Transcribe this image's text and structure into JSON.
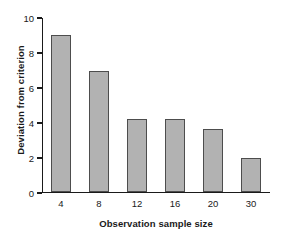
{
  "chart_data": {
    "type": "bar",
    "title": "",
    "xlabel": "Observation sample size",
    "ylabel": "Deviation from criterion",
    "categories": [
      "4",
      "8",
      "12",
      "16",
      "20",
      "30"
    ],
    "values": [
      9.0,
      6.9,
      4.15,
      4.15,
      3.6,
      1.95
    ],
    "ylim": [
      0,
      10
    ],
    "yticks": [
      "0",
      "2",
      "4",
      "6",
      "8",
      "10"
    ],
    "ytick_values": [
      0,
      2,
      4,
      6,
      8,
      10
    ],
    "grid": false,
    "legend": null,
    "bar_color": "#b2b2b2",
    "bar_edge_color": "#4d4d4d",
    "axis_color": "#1a1a1a",
    "background": "#ffffff"
  }
}
